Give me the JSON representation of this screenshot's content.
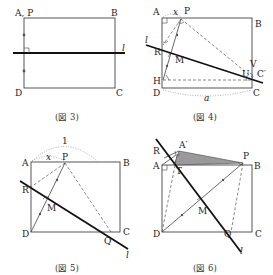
{
  "figures": [
    {
      "id": "fig3",
      "caption": "(図 3)",
      "labels": {
        "A": "A, P",
        "B": "B",
        "C": "C",
        "D": "D",
        "l": "l"
      }
    },
    {
      "id": "fig4",
      "caption": "(図 4)",
      "labels": {
        "A": "A",
        "x": "x",
        "P": "P",
        "B": "B",
        "l": "l",
        "R": "R",
        "M": "M",
        "V": "V",
        "C_prime": "C′",
        "U": "U",
        "H": "H",
        "D": "D",
        "C": "C",
        "a": "a"
      }
    },
    {
      "id": "fig5",
      "caption": "(図 5)",
      "labels": {
        "one": "1",
        "A": "A",
        "x": "x",
        "P": "P",
        "B": "B",
        "R": "R",
        "M": "M",
        "D": "D",
        "Q": "Q",
        "C": "C",
        "l": "l"
      }
    },
    {
      "id": "fig6",
      "caption": "(図 6)",
      "labels": {
        "A_prime": "A′",
        "R": "R",
        "A": "A",
        "T": "T",
        "P": "P",
        "B": "B",
        "M": "M",
        "D": "D",
        "Q": "Q",
        "C": "C",
        "l": "l"
      }
    }
  ]
}
